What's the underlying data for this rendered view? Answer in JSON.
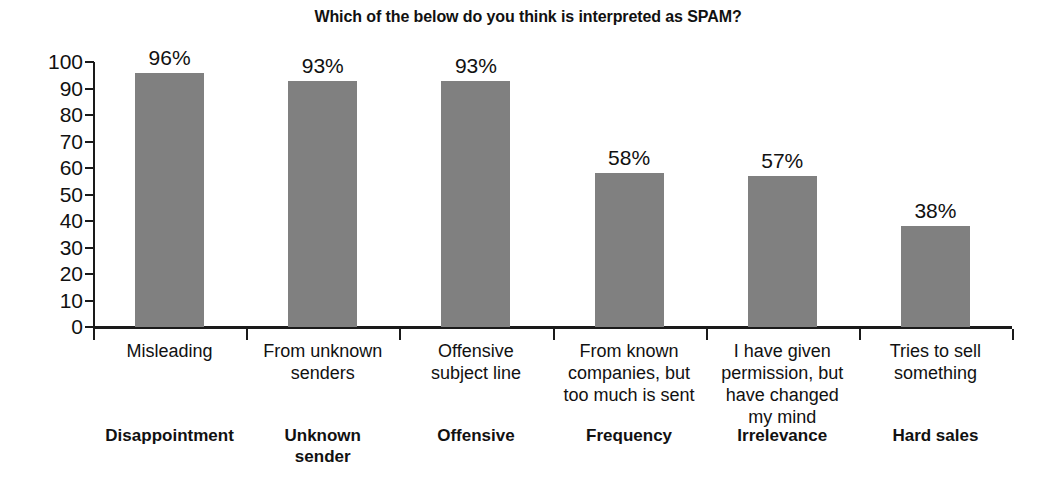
{
  "chart_data": {
    "type": "bar",
    "title": "Which of the below do you think is interpreted as SPAM?",
    "xlabel": "",
    "ylabel": "",
    "ylim": [
      0,
      100
    ],
    "ytick_step": 10,
    "ytick_labels": [
      "100",
      "90",
      "80",
      "70",
      "60",
      "50",
      "40",
      "30",
      "20",
      "10",
      "0"
    ],
    "grid": false,
    "legend": "none",
    "bar_color": "#808080",
    "axis_color": "#1a1a1a",
    "categories": [
      "Misleading",
      "From unknown senders",
      "Offensive subject line",
      "From known companies, but too much is sent",
      "I have given permission, but have changed my mind",
      "Tries to sell something"
    ],
    "category_short_names": [
      "Disappointment",
      "Unknown sender",
      "Offensive",
      "Frequency",
      "Irrelevance",
      "Hard sales"
    ],
    "values": [
      96,
      93,
      93,
      58,
      57,
      38
    ],
    "data_labels": [
      "96%",
      "93%",
      "93%",
      "58%",
      "57%",
      "38%"
    ],
    "bars": [
      {
        "value": 96,
        "label": "96%",
        "desc_lines": [
          "Misleading"
        ],
        "name_lines": [
          "Disappointment"
        ]
      },
      {
        "value": 93,
        "label": "93%",
        "desc_lines": [
          "From unknown",
          "senders"
        ],
        "name_lines": [
          "Unknown",
          "sender"
        ]
      },
      {
        "value": 93,
        "label": "93%",
        "desc_lines": [
          "Offensive",
          "subject line"
        ],
        "name_lines": [
          "Offensive"
        ]
      },
      {
        "value": 58,
        "label": "58%",
        "desc_lines": [
          "From known",
          "companies, but",
          "too much is sent"
        ],
        "name_lines": [
          "Frequency"
        ]
      },
      {
        "value": 57,
        "label": "57%",
        "desc_lines": [
          "I have given",
          "permission, but",
          "have changed",
          "my mind"
        ],
        "name_lines": [
          "Irrelevance"
        ]
      },
      {
        "value": 38,
        "label": "38%",
        "desc_lines": [
          "Tries to sell",
          "something"
        ],
        "name_lines": [
          "Hard sales"
        ]
      }
    ]
  }
}
